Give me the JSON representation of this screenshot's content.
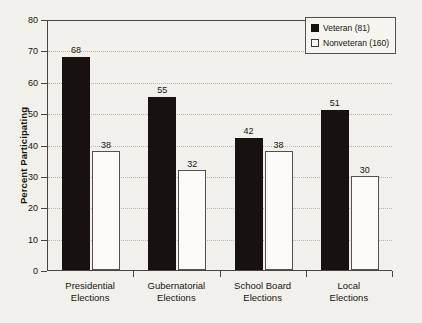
{
  "chart_data": {
    "type": "bar",
    "title": "",
    "xlabel": "",
    "ylabel": "Percent Participating",
    "ylim": [
      0,
      80
    ],
    "ytick_step": 10,
    "yticks": [
      0,
      10,
      20,
      30,
      40,
      50,
      60,
      70,
      80
    ],
    "grid": true,
    "grid_axis": "y",
    "legend_position": "top-right",
    "categories": [
      "Presidential Elections",
      "Gubernatorial Elections",
      "School Board Elections",
      "Local Elections"
    ],
    "category_lines": [
      [
        "Presidential",
        "Elections"
      ],
      [
        "Gubernatorial",
        "Elections"
      ],
      [
        "School Board",
        "Elections"
      ],
      [
        "Local",
        "Elections"
      ]
    ],
    "series": [
      {
        "name": "Veteran (81)",
        "short_name": "Veteran",
        "n": 81,
        "color": "#17120d",
        "values": [
          68,
          55,
          42,
          51
        ]
      },
      {
        "name": "Nonveteran (160)",
        "short_name": "Nonveteran",
        "n": 160,
        "color": "#fbfaf6",
        "border_color": "#55514a",
        "values": [
          38,
          32,
          38,
          30
        ]
      }
    ]
  },
  "legend": {
    "items": [
      {
        "label": "Veteran (81)",
        "swatch": "filled-black-square"
      },
      {
        "label": "Nonveteran (160)",
        "swatch": "outlined-white-square"
      }
    ]
  },
  "axes": {
    "y_title": "Percent Participating",
    "y_tick_labels": [
      "80",
      "70",
      "60",
      "50",
      "40",
      "30",
      "20",
      "10",
      "0"
    ]
  },
  "style": {
    "background": "#f2f0ea",
    "axis_color": "#4a463f",
    "grid_color": "#b9b5ab",
    "text_color": "#17140f"
  }
}
